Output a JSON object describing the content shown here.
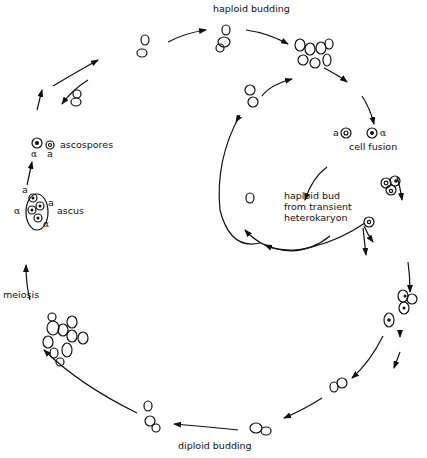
{
  "diagram": {
    "type": "yeast-life-cycle",
    "colors": {
      "ink": "#111111",
      "background": "#ffffff"
    },
    "labels": {
      "haploid_budding": "haploid budding",
      "ascospores": "ascospores",
      "ascus": "ascus",
      "meiosis": "meiosis",
      "diploid_budding": "diploid budding",
      "cell_fusion": "cell fusion",
      "haploid_bud_line1": "haploid bud",
      "haploid_bud_line2": "from transient",
      "haploid_bud_line3": "heterokaryon"
    },
    "mating_types": {
      "a": "a",
      "alpha": "α"
    }
  }
}
